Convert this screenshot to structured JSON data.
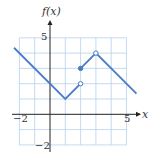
{
  "chart_data": {
    "type": "line",
    "title": "",
    "xlabel": "x",
    "ylabel": "f(x)",
    "xlim": [
      -2,
      5
    ],
    "ylim": [
      -2,
      5
    ],
    "grid": true,
    "x_ticks_labeled": [
      "-2",
      "5"
    ],
    "y_ticks_labeled": [
      "5",
      "-2"
    ],
    "colors": {
      "line": "#4a7cc7",
      "grid": "#b8d0ee",
      "axis": "#222222"
    },
    "segments": [
      {
        "points": [
          [
            -2.35,
            4.35
          ],
          [
            1,
            1
          ],
          [
            2,
            2
          ]
        ],
        "start": "none",
        "end": "open"
      },
      {
        "points": [
          [
            2,
            3
          ],
          [
            3,
            4
          ],
          [
            5.65,
            1.35
          ]
        ],
        "start": "closed",
        "end": "arrow-free"
      }
    ],
    "marked_points": [
      {
        "x": 2,
        "y": 2,
        "style": "open"
      },
      {
        "x": 2,
        "y": 3,
        "style": "closed"
      },
      {
        "x": 3,
        "y": 4,
        "style": "open"
      }
    ],
    "tick_labels": {
      "x_neg2": "−2",
      "x_5": "5",
      "y_5": "5",
      "y_neg2": "−2"
    },
    "axis_labels": {
      "x": "x",
      "y": "f(x)"
    }
  }
}
